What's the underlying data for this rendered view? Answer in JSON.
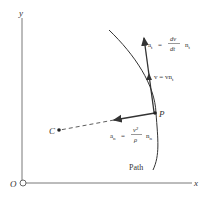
{
  "axes": {
    "x_label": "x",
    "y_label": "y",
    "origin_label": "O"
  },
  "points": {
    "p_label": "P",
    "c_label": "C"
  },
  "path_label": "Path",
  "tangential_accel": {
    "lhs": "a",
    "lhs_sub": "t",
    "equals": "=",
    "num": "dv",
    "den": "dt",
    "unit": "n",
    "unit_sub": "t"
  },
  "velocity": {
    "text": "v = vn",
    "sub": "t"
  },
  "normal_accel": {
    "lhs": "a",
    "lhs_sub": "n",
    "equals": "=",
    "num": "v²",
    "den": "ρ",
    "unit": "n",
    "unit_sub": "n"
  },
  "colors": {
    "ink": "#333333",
    "background": "#ffffff"
  }
}
